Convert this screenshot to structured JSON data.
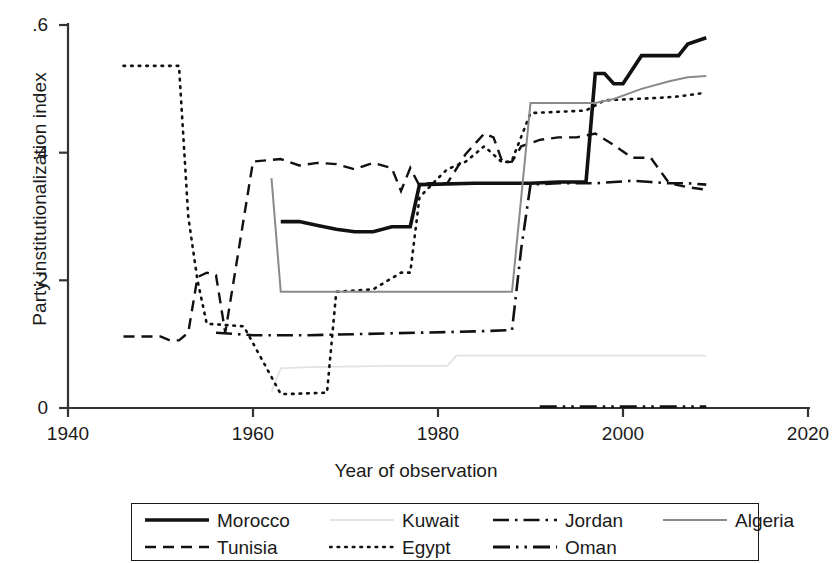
{
  "chart_data": {
    "type": "line",
    "title": "",
    "xlabel": "Year of observation",
    "ylabel": "Party institutionalization index",
    "xlim": [
      1940,
      2020
    ],
    "ylim": [
      0,
      0.6
    ],
    "xticks": [
      "1940",
      "1960",
      "1980",
      "2000",
      "2020"
    ],
    "xtick_values": [
      1940,
      1960,
      1980,
      2000,
      2020
    ],
    "yticks": [
      "0",
      ".2",
      ".4",
      ".6"
    ],
    "ytick_values": [
      0,
      0.2,
      0.4,
      0.6
    ],
    "grid": false,
    "legend_position": "bottom",
    "series": [
      {
        "name": "Morocco",
        "style": "solid-thick",
        "color": "#111111",
        "width": 3.6,
        "points": [
          [
            1963,
            0.292
          ],
          [
            1965,
            0.292
          ],
          [
            1967,
            0.286
          ],
          [
            1969,
            0.28
          ],
          [
            1971,
            0.276
          ],
          [
            1973,
            0.276
          ],
          [
            1975,
            0.284
          ],
          [
            1977,
            0.284
          ],
          [
            1978,
            0.35
          ],
          [
            1984,
            0.352
          ],
          [
            1985,
            0.352
          ],
          [
            1990,
            0.352
          ],
          [
            1993,
            0.354
          ],
          [
            1996,
            0.354
          ],
          [
            1997,
            0.524
          ],
          [
            1998,
            0.524
          ],
          [
            1999,
            0.508
          ],
          [
            2000,
            0.508
          ],
          [
            2002,
            0.552
          ],
          [
            2006,
            0.552
          ],
          [
            2007,
            0.57
          ],
          [
            2009,
            0.58
          ]
        ]
      },
      {
        "name": "Tunisia",
        "style": "dashed",
        "color": "#111111",
        "width": 2.4,
        "points": [
          [
            1946,
            0.112
          ],
          [
            1950,
            0.112
          ],
          [
            1951,
            0.106
          ],
          [
            1952,
            0.106
          ],
          [
            1953,
            0.118
          ],
          [
            1954,
            0.205
          ],
          [
            1955,
            0.212
          ],
          [
            1956,
            0.208
          ],
          [
            1957,
            0.118
          ],
          [
            1960,
            0.386
          ],
          [
            1963,
            0.39
          ],
          [
            1965,
            0.38
          ],
          [
            1967,
            0.384
          ],
          [
            1969,
            0.382
          ],
          [
            1971,
            0.374
          ],
          [
            1973,
            0.384
          ],
          [
            1975,
            0.376
          ],
          [
            1976,
            0.34
          ],
          [
            1977,
            0.376
          ],
          [
            1978,
            0.348
          ],
          [
            1979,
            0.352
          ],
          [
            1981,
            0.352
          ],
          [
            1983,
            0.398
          ],
          [
            1985,
            0.43
          ],
          [
            1986,
            0.424
          ],
          [
            1987,
            0.384
          ],
          [
            1988,
            0.386
          ],
          [
            1989,
            0.41
          ],
          [
            1991,
            0.42
          ],
          [
            1993,
            0.424
          ],
          [
            1995,
            0.424
          ],
          [
            1997,
            0.43
          ],
          [
            1999,
            0.412
          ],
          [
            2001,
            0.392
          ],
          [
            2003,
            0.392
          ],
          [
            2005,
            0.352
          ],
          [
            2007,
            0.346
          ],
          [
            2009,
            0.342
          ]
        ]
      },
      {
        "name": "Kuwait",
        "style": "solid-faint",
        "color": "#e2e2e2",
        "width": 1.8,
        "points": [
          [
            1962,
            0.026
          ],
          [
            1963,
            0.062
          ],
          [
            1966,
            0.064
          ],
          [
            1975,
            0.066
          ],
          [
            1981,
            0.066
          ],
          [
            1982,
            0.082
          ],
          [
            1986,
            0.082
          ],
          [
            1996,
            0.082
          ],
          [
            2009,
            0.082
          ]
        ]
      },
      {
        "name": "Egypt",
        "style": "dotted",
        "color": "#111111",
        "width": 2.6,
        "points": [
          [
            1946,
            0.536
          ],
          [
            1952,
            0.536
          ],
          [
            1953,
            0.3
          ],
          [
            1954,
            0.2
          ],
          [
            1955,
            0.132
          ],
          [
            1957,
            0.13
          ],
          [
            1959,
            0.128
          ],
          [
            1963,
            0.022
          ],
          [
            1964,
            0.022
          ],
          [
            1968,
            0.024
          ],
          [
            1969,
            0.182
          ],
          [
            1973,
            0.186
          ],
          [
            1976,
            0.212
          ],
          [
            1977,
            0.212
          ],
          [
            1978,
            0.33
          ],
          [
            1980,
            0.36
          ],
          [
            1981,
            0.374
          ],
          [
            1983,
            0.386
          ],
          [
            1985,
            0.41
          ],
          [
            1987,
            0.384
          ],
          [
            1988,
            0.388
          ],
          [
            1990,
            0.462
          ],
          [
            1993,
            0.464
          ],
          [
            1996,
            0.466
          ],
          [
            1998,
            0.482
          ],
          [
            2001,
            0.484
          ],
          [
            2004,
            0.486
          ],
          [
            2006,
            0.488
          ],
          [
            2009,
            0.494
          ]
        ]
      },
      {
        "name": "Jordan",
        "style": "dash-dot",
        "color": "#111111",
        "width": 2.6,
        "points": [
          [
            1956,
            0.118
          ],
          [
            1960,
            0.114
          ],
          [
            1966,
            0.114
          ],
          [
            1972,
            0.116
          ],
          [
            1978,
            0.118
          ],
          [
            1984,
            0.12
          ],
          [
            1988,
            0.122
          ],
          [
            1989,
            0.25
          ],
          [
            1990,
            0.35
          ],
          [
            1993,
            0.352
          ],
          [
            1997,
            0.352
          ],
          [
            2001,
            0.356
          ],
          [
            2003,
            0.354
          ],
          [
            2005,
            0.352
          ],
          [
            2007,
            0.352
          ],
          [
            2009,
            0.35
          ]
        ]
      },
      {
        "name": "Oman",
        "style": "dash-dot-dot",
        "color": "#111111",
        "width": 2.8,
        "points": [
          [
            1991,
            0.002
          ],
          [
            1997,
            0.002
          ],
          [
            2003,
            0.002
          ],
          [
            2009,
            0.002
          ]
        ]
      },
      {
        "name": "Algeria",
        "style": "solid-gray",
        "color": "#8a8a8a",
        "width": 2.0,
        "points": [
          [
            1962,
            0.36
          ],
          [
            1963,
            0.182
          ],
          [
            1970,
            0.182
          ],
          [
            1980,
            0.182
          ],
          [
            1987,
            0.182
          ],
          [
            1988,
            0.182
          ],
          [
            1989,
            0.33
          ],
          [
            1990,
            0.478
          ],
          [
            1994,
            0.478
          ],
          [
            1997,
            0.478
          ],
          [
            1999,
            0.484
          ],
          [
            2002,
            0.5
          ],
          [
            2005,
            0.512
          ],
          [
            2007,
            0.518
          ],
          [
            2009,
            0.52
          ]
        ]
      }
    ],
    "legend": [
      {
        "label": "Morocco",
        "style": "solid-thick"
      },
      {
        "label": "Kuwait",
        "style": "solid-faint"
      },
      {
        "label": "Jordan",
        "style": "dash-dot"
      },
      {
        "label": "Algeria",
        "style": "solid-gray"
      },
      {
        "label": "Tunisia",
        "style": "dashed"
      },
      {
        "label": "Egypt",
        "style": "dotted"
      },
      {
        "label": "Oman",
        "style": "dash-dot-dot"
      }
    ]
  }
}
